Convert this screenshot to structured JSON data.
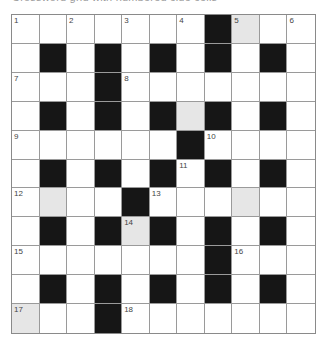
{
  "header": {
    "text": "Crossword grid with numbered clue cells"
  },
  "colors": {
    "black_cell": "#161616",
    "highlight_cell": "#e6e6e6",
    "white_cell": "#ffffff",
    "grid_line": "#9a9a9a"
  },
  "grid": {
    "rows": 11,
    "cols": 11,
    "layout": [
      "WWWWWWWBGWW",
      "WBWBWBWBWBW",
      "WWWBWWWWWWW",
      "WBWBWBGBWBW",
      "WWWWWWBWWWW",
      "WBWBWBWBWBW",
      "WGWWBWWWGWW",
      "WBWBGBWBWBW",
      "WWWWWWWBWWW",
      "WBWBWBWBWBW",
      "GWWBWWWWWWW"
    ],
    "numbers": [
      {
        "row": 0,
        "col": 0,
        "n": "1"
      },
      {
        "row": 0,
        "col": 2,
        "n": "2"
      },
      {
        "row": 0,
        "col": 4,
        "n": "3"
      },
      {
        "row": 0,
        "col": 6,
        "n": "4"
      },
      {
        "row": 0,
        "col": 8,
        "n": "5"
      },
      {
        "row": 0,
        "col": 10,
        "n": "6"
      },
      {
        "row": 2,
        "col": 0,
        "n": "7"
      },
      {
        "row": 2,
        "col": 4,
        "n": "8"
      },
      {
        "row": 4,
        "col": 0,
        "n": "9"
      },
      {
        "row": 4,
        "col": 7,
        "n": "10"
      },
      {
        "row": 5,
        "col": 6,
        "n": "11"
      },
      {
        "row": 6,
        "col": 0,
        "n": "12"
      },
      {
        "row": 6,
        "col": 5,
        "n": "13"
      },
      {
        "row": 7,
        "col": 4,
        "n": "14"
      },
      {
        "row": 8,
        "col": 0,
        "n": "15"
      },
      {
        "row": 8,
        "col": 8,
        "n": "16"
      },
      {
        "row": 10,
        "col": 0,
        "n": "17"
      },
      {
        "row": 10,
        "col": 4,
        "n": "18"
      }
    ]
  }
}
